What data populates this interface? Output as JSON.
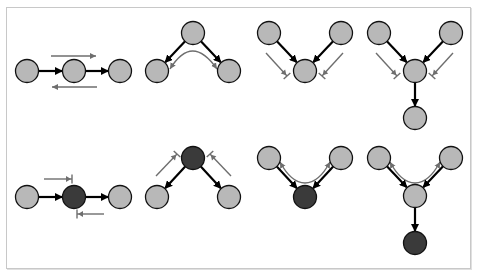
{
  "diagram": {
    "title": "",
    "colors": {
      "observed_node": "#3a3a3a",
      "unobserved_node": "#b8b8b8",
      "node_stroke": "#111111",
      "edge": "#000000",
      "flow_arrow": "#6e6e6e",
      "frame": "#c8c8c8"
    },
    "node_radius": 11.5,
    "panels": [
      {
        "id": "chain-unobserved",
        "nodes": [
          {
            "x": 27,
            "y": 71,
            "observed": false
          },
          {
            "x": 74,
            "y": 71,
            "observed": false
          },
          {
            "x": 120,
            "y": 71,
            "observed": false
          }
        ],
        "edges": [
          [
            0,
            1
          ],
          [
            1,
            2
          ]
        ],
        "flows": [
          {
            "type": "line",
            "d": "M51 56 L96 56",
            "head": "arrow"
          },
          {
            "type": "line",
            "d": "M97 87 L52 87",
            "head": "arrow"
          }
        ]
      },
      {
        "id": "fork-unobserved",
        "nodes": [
          {
            "x": 193,
            "y": 33,
            "observed": false
          },
          {
            "x": 157,
            "y": 71,
            "observed": false
          },
          {
            "x": 229,
            "y": 71,
            "observed": false
          }
        ],
        "edges": [
          [
            0,
            1
          ],
          [
            0,
            2
          ]
        ],
        "flows": [
          {
            "type": "curve",
            "d": "M170 69 C 185 45, 200 45, 217 69",
            "head": "both-arrow"
          }
        ]
      },
      {
        "id": "collider-unobserved",
        "nodes": [
          {
            "x": 269,
            "y": 33,
            "observed": false
          },
          {
            "x": 341,
            "y": 33,
            "observed": false
          },
          {
            "x": 305,
            "y": 71,
            "observed": false
          }
        ],
        "edges": [
          [
            0,
            2
          ],
          [
            1,
            2
          ]
        ],
        "flows": [
          {
            "type": "line",
            "d": "M266 53 L287 76",
            "head": "blocked"
          },
          {
            "type": "line",
            "d": "M343 53 L322 76",
            "head": "blocked"
          }
        ]
      },
      {
        "id": "collider-descendant-unobserved",
        "nodes": [
          {
            "x": 379,
            "y": 33,
            "observed": false
          },
          {
            "x": 451,
            "y": 33,
            "observed": false
          },
          {
            "x": 415,
            "y": 71,
            "observed": false
          },
          {
            "x": 415,
            "y": 118,
            "observed": false
          }
        ],
        "edges": [
          [
            0,
            2
          ],
          [
            1,
            2
          ],
          [
            2,
            3
          ]
        ],
        "flows": [
          {
            "type": "line",
            "d": "M376 53 L397 76",
            "head": "blocked"
          },
          {
            "type": "line",
            "d": "M453 53 L432 76",
            "head": "blocked"
          }
        ]
      },
      {
        "id": "chain-observed",
        "nodes": [
          {
            "x": 27,
            "y": 197,
            "observed": false
          },
          {
            "x": 74,
            "y": 197,
            "observed": true
          },
          {
            "x": 120,
            "y": 197,
            "observed": false
          }
        ],
        "edges": [
          [
            0,
            1
          ],
          [
            1,
            2
          ]
        ],
        "flows": [
          {
            "type": "line",
            "d": "M44 179 L72 179",
            "head": "blocked"
          },
          {
            "type": "line",
            "d": "M104 214 L77 214",
            "head": "blocked"
          }
        ]
      },
      {
        "id": "fork-observed",
        "nodes": [
          {
            "x": 193,
            "y": 158,
            "observed": true
          },
          {
            "x": 157,
            "y": 197,
            "observed": false
          },
          {
            "x": 229,
            "y": 197,
            "observed": false
          }
        ],
        "edges": [
          [
            0,
            1
          ],
          [
            0,
            2
          ]
        ],
        "flows": [
          {
            "type": "line",
            "d": "M156 176 L177 154",
            "head": "blocked"
          },
          {
            "type": "line",
            "d": "M231 176 L210 154",
            "head": "blocked"
          }
        ]
      },
      {
        "id": "collider-observed",
        "nodes": [
          {
            "x": 269,
            "y": 158,
            "observed": false
          },
          {
            "x": 341,
            "y": 158,
            "observed": false
          },
          {
            "x": 305,
            "y": 197,
            "observed": true
          }
        ],
        "edges": [
          [
            0,
            2
          ],
          [
            1,
            2
          ]
        ],
        "flows": [
          {
            "type": "curve",
            "d": "M280 162 C 295 190, 315 190, 330 162",
            "head": "both-arrow"
          }
        ]
      },
      {
        "id": "collider-descendant-observed",
        "nodes": [
          {
            "x": 379,
            "y": 158,
            "observed": false
          },
          {
            "x": 451,
            "y": 158,
            "observed": false
          },
          {
            "x": 415,
            "y": 196,
            "observed": false
          },
          {
            "x": 415,
            "y": 243,
            "observed": true
          }
        ],
        "edges": [
          [
            0,
            2
          ],
          [
            1,
            2
          ],
          [
            2,
            3
          ]
        ],
        "flows": [
          {
            "type": "curve",
            "d": "M390 162 C 405 190, 425 190, 440 162",
            "head": "both-arrow"
          }
        ]
      }
    ]
  }
}
